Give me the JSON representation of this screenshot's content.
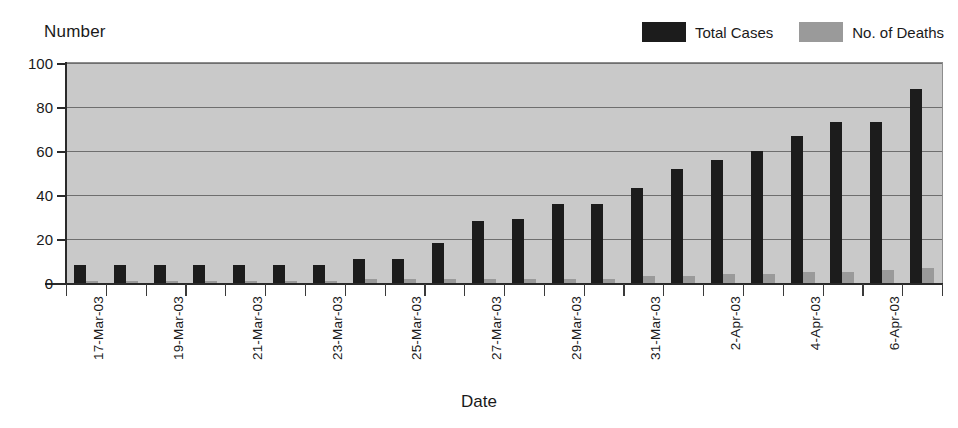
{
  "chart_data": {
    "type": "bar",
    "title": "",
    "ylabel": "Number",
    "xlabel": "Date",
    "ylim": [
      0,
      100
    ],
    "yticks": [
      0,
      20,
      40,
      60,
      80,
      100
    ],
    "grid": true,
    "legend_position": "top-right",
    "categories": [
      "17-Mar-03",
      "18-Mar-03",
      "19-Mar-03",
      "20-Mar-03",
      "21-Mar-03",
      "22-Mar-03",
      "23-Mar-03",
      "24-Mar-03",
      "25-Mar-03",
      "26-Mar-03",
      "27-Mar-03",
      "28-Mar-03",
      "29-Mar-03",
      "30-Mar-03",
      "31-Mar-03",
      "1-Apr-03",
      "2-Apr-03",
      "3-Apr-03",
      "4-Apr-03",
      "5-Apr-03",
      "6-Apr-03",
      "7-Apr-03"
    ],
    "visible_tick_labels": [
      "17-Mar-03",
      "19-Mar-03",
      "21-Mar-03",
      "23-Mar-03",
      "25-Mar-03",
      "27-Mar-03",
      "29-Mar-03",
      "31-Mar-03",
      "2-Apr-03",
      "4-Apr-03",
      "6-Apr-03"
    ],
    "series": [
      {
        "name": "Total Cases",
        "color": "#1c1c1c",
        "values": [
          8,
          8,
          8,
          8,
          8,
          8,
          8,
          11,
          11,
          18,
          28,
          29,
          36,
          36,
          43,
          52,
          56,
          60,
          67,
          73,
          73,
          88
        ]
      },
      {
        "name": "No. of Deaths",
        "color": "#9a9a9a",
        "values": [
          1,
          1,
          1,
          1,
          1,
          1,
          1,
          2,
          2,
          2,
          2,
          2,
          2,
          2,
          3,
          3,
          4,
          4,
          5,
          5,
          6,
          7
        ]
      }
    ]
  },
  "axes": {
    "y_title": "Number",
    "x_title": "Date"
  },
  "legend": {
    "items": [
      {
        "label": "Total Cases",
        "color": "#1c1c1c"
      },
      {
        "label": "No. of Deaths",
        "color": "#9a9a9a"
      }
    ]
  },
  "style": {
    "plot_background": "#c9c9c9",
    "page_background": "#ffffff",
    "gridline_color": "#6e6e6e",
    "axis_color": "#2a2a2a",
    "text_color": "#1a1a1a"
  }
}
